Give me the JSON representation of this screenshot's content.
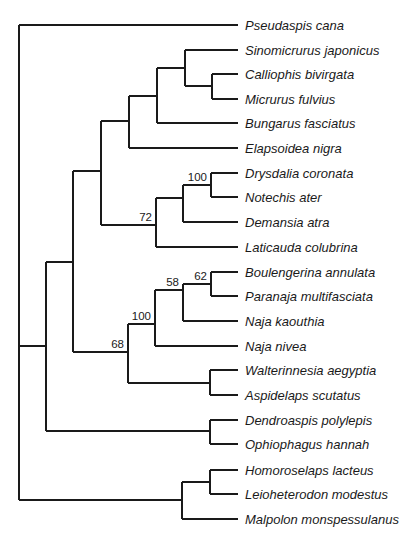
{
  "figure": {
    "type": "phylogenetic-tree",
    "orientation": "rooted, left-to-right",
    "line_color": "#1a1a1a",
    "label_x": 245,
    "tip_x": 238,
    "taxa": [
      {
        "id": "t0",
        "name": "Pseudaspis cana",
        "y": 25
      },
      {
        "id": "t1",
        "name": "Sinomicrurus japonicus",
        "y": 50
      },
      {
        "id": "t2",
        "name": "Calliophis bivirgata",
        "y": 74
      },
      {
        "id": "t3",
        "name": "Micrurus fulvius",
        "y": 99
      },
      {
        "id": "t4",
        "name": "Bungarus fasciatus",
        "y": 123
      },
      {
        "id": "t5",
        "name": "Elapsoidea nigra",
        "y": 148
      },
      {
        "id": "t6",
        "name": "Drysdalia coronata",
        "y": 173
      },
      {
        "id": "t7",
        "name": "Notechis ater",
        "y": 197
      },
      {
        "id": "t8",
        "name": "Demansia atra",
        "y": 222
      },
      {
        "id": "t9",
        "name": "Laticauda colubrina",
        "y": 247
      },
      {
        "id": "t10",
        "name": "Boulengerina annulata",
        "y": 272
      },
      {
        "id": "t11",
        "name": "Paranaja multifasciata",
        "y": 296
      },
      {
        "id": "t12",
        "name": "Naja kaouthia",
        "y": 321
      },
      {
        "id": "t13",
        "name": "Naja nivea",
        "y": 346
      },
      {
        "id": "t14",
        "name": "Walterinnesia aegyptia",
        "y": 370
      },
      {
        "id": "t15",
        "name": "Aspidelaps scutatus",
        "y": 395
      },
      {
        "id": "t16",
        "name": "Dendroaspis polylepis",
        "y": 420
      },
      {
        "id": "t17",
        "name": "Ophiophagus hannah",
        "y": 444
      },
      {
        "id": "t18",
        "name": "Homoroselaps lacteus",
        "y": 470
      },
      {
        "id": "t19",
        "name": "Leioheterodon modestus",
        "y": 494
      },
      {
        "id": "t20",
        "name": "Malpolon monspessulanus",
        "y": 519
      }
    ],
    "nodes": [
      {
        "id": "root",
        "x": 19,
        "children": [
          "t0",
          "nA",
          "nM"
        ]
      },
      {
        "id": "nA",
        "x": 46,
        "children": [
          "nB",
          "nDO"
        ]
      },
      {
        "id": "nB",
        "x": 73,
        "children": [
          "nC",
          "nD"
        ]
      },
      {
        "id": "nC",
        "x": 101,
        "children": [
          "nE",
          "nF"
        ]
      },
      {
        "id": "nE",
        "x": 129,
        "children": [
          "nG",
          "t5"
        ]
      },
      {
        "id": "nG",
        "x": 157,
        "children": [
          "nH",
          "t4"
        ]
      },
      {
        "id": "nH",
        "x": 185,
        "children": [
          "t1",
          "nI"
        ]
      },
      {
        "id": "nI",
        "x": 212,
        "children": [
          "t2",
          "t3"
        ]
      },
      {
        "id": "nF",
        "x": 156,
        "support": "72",
        "children": [
          "nJ",
          "t9"
        ]
      },
      {
        "id": "nJ",
        "x": 183,
        "children": [
          "nK",
          "t8"
        ]
      },
      {
        "id": "nK",
        "x": 211,
        "support": "100",
        "children": [
          "t6",
          "t7"
        ]
      },
      {
        "id": "nD",
        "x": 128,
        "support": "68",
        "children": [
          "nL",
          "nWA"
        ]
      },
      {
        "id": "nL",
        "x": 155,
        "support": "100",
        "children": [
          "nN",
          "t13"
        ]
      },
      {
        "id": "nN",
        "x": 183,
        "support": "58",
        "children": [
          "nP",
          "t12"
        ]
      },
      {
        "id": "nP",
        "x": 211,
        "support": "62",
        "children": [
          "t10",
          "t11"
        ]
      },
      {
        "id": "nWA",
        "x": 210,
        "children": [
          "t14",
          "t15"
        ]
      },
      {
        "id": "nDO",
        "x": 210,
        "children": [
          "t16",
          "t17"
        ]
      },
      {
        "id": "nM",
        "x": 182,
        "children": [
          "nQ",
          "t20"
        ]
      },
      {
        "id": "nQ",
        "x": 210,
        "children": [
          "t18",
          "t19"
        ]
      }
    ],
    "support_values": [
      {
        "node": "nF",
        "value": "72",
        "clade": "Drysdalia, Notechis, Demansia, Laticauda"
      },
      {
        "node": "nK",
        "value": "100",
        "clade": "Drysdalia coronata + Notechis ater"
      },
      {
        "node": "nD",
        "value": "68",
        "clade": "Boulengerina ... Aspidelaps"
      },
      {
        "node": "nL",
        "value": "100",
        "clade": "Boulengerina, Paranaja, Naja kaouthia, Naja nivea"
      },
      {
        "node": "nN",
        "value": "58",
        "clade": "Boulengerina, Paranaja, Naja kaouthia"
      },
      {
        "node": "nP",
        "value": "62",
        "clade": "Boulengerina annulata + Paranaja multifasciata"
      }
    ]
  }
}
